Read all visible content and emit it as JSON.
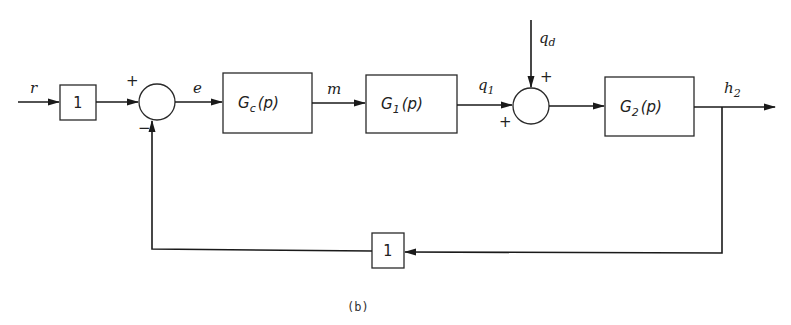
{
  "diagram": {
    "type": "block-diagram",
    "caption": "(b)",
    "signals": {
      "r": "r",
      "e": "e",
      "m": "m",
      "q1": "q",
      "q1_sub": "1",
      "qd": "q",
      "qd_sub": "d",
      "h2": "h",
      "h2_sub": "2"
    },
    "blocks": {
      "input_gain": "1",
      "controller": {
        "name": "G",
        "sub": "c",
        "arg": "(p)"
      },
      "process1": {
        "name": "G",
        "sub": "1",
        "arg": "(p)"
      },
      "process2": {
        "name": "G",
        "sub": "2",
        "arg": "(p)"
      },
      "feedback_gain": "1"
    },
    "junctions": {
      "sum1": {
        "top_sign": "+",
        "bottom_sign": "−"
      },
      "sum2": {
        "top_sign": "+",
        "left_sign": "+"
      }
    },
    "colors": {
      "line": "#1a1a1a",
      "background": "#ffffff"
    }
  }
}
